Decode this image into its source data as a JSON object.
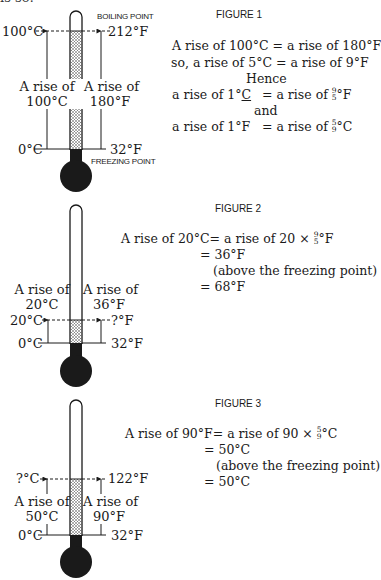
{
  "cutoff_text": "is so:",
  "figure1": {
    "caption": "FIGURE 1",
    "boiling_label": "BOILING POINT",
    "freezing_label": "FREEZING POINT",
    "left_top": "100°C",
    "left_bottom": "0°C",
    "right_top": "212°F",
    "right_bottom": "32°F",
    "left_rise_line1": "A rise of",
    "left_rise_line2": "100°C",
    "right_rise_line1": "A rise of",
    "right_rise_line2": "180°F",
    "eq1": "A rise of 100°C  = a rise of 180°F",
    "eq2": "so, a rise of 5°C = a rise of 9°F",
    "hence": "Hence",
    "eq3_left": "a rise of 1°",
    "eq3_left_u": "C",
    "eq3_right": "= a rise of ",
    "eq3_num": "9",
    "eq3_den": "5",
    "eq3_unit": "°F",
    "and": "and",
    "eq4_left": "a rise of 1°F",
    "eq4_right": "= a rise of ",
    "eq4_num": "5",
    "eq4_den": "9",
    "eq4_unit": "°C"
  },
  "figure2": {
    "caption": "FIGURE 2",
    "left_top": "20°C",
    "left_bottom": "0°C",
    "right_top": "?°F",
    "right_bottom": "32°F",
    "left_rise_line1": "A rise of",
    "left_rise_line2": "20°C",
    "right_rise_line1": "A rise of",
    "right_rise_line2": "36°F",
    "eq1_left": "A rise of 20°C",
    "eq1_right": "= a rise of 20 × ",
    "eq1_num": "9",
    "eq1_den": "5",
    "eq1_unit": "°F",
    "eq2": "= 36°F",
    "eq3": "(above the freezing point)",
    "eq4": "= 68°F"
  },
  "figure3": {
    "caption": "FIGURE 3",
    "left_top": "?°C",
    "left_bottom": "0°C",
    "right_top": "122°F",
    "right_bottom": "32°F",
    "left_rise_line1": "A rise of",
    "left_rise_line2": "50°C",
    "right_rise_line1": "A rise of",
    "right_rise_line2": "90°F",
    "eq1_left": "A rise of 90°F",
    "eq1_right": "= a rise of 90 × ",
    "eq1_num": "5",
    "eq1_den": "9",
    "eq1_unit": "°C",
    "eq2": "= 50°C",
    "eq3": "(above the freezing point)",
    "eq4": "= 50°C"
  },
  "colors": {
    "ink": "#1a1a1a",
    "background": "#ffffff"
  }
}
